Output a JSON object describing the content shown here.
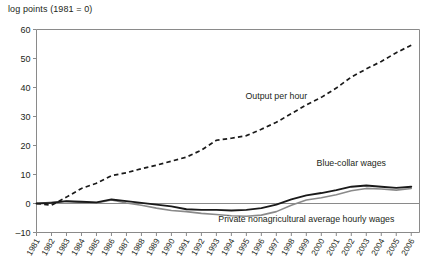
{
  "chart_data": {
    "type": "line",
    "title": "",
    "ylabel": "log points (1981 = 0)",
    "xlabel": "",
    "ylim": [
      -10,
      60
    ],
    "yticks": [
      -10,
      0,
      10,
      20,
      30,
      40,
      50,
      60
    ],
    "ytick_labels": [
      "–10",
      "0",
      "10",
      "20",
      "30",
      "40",
      "50",
      "60"
    ],
    "xlim": [
      1981,
      2006
    ],
    "grid": false,
    "legend_position": "inline-annotations",
    "categories": [
      1981,
      1982,
      1983,
      1984,
      1985,
      1986,
      1987,
      1988,
      1989,
      1990,
      1991,
      1992,
      1993,
      1994,
      1995,
      1996,
      1997,
      1998,
      1999,
      2000,
      2001,
      2002,
      2003,
      2004,
      2005,
      2006
    ],
    "xtick_labels": [
      "1981",
      "1982",
      "1983",
      "1984",
      "1985",
      "1986",
      "1987",
      "1988",
      "1989",
      "1990",
      "1991",
      "1992",
      "1993",
      "1994",
      "1995",
      "1996",
      "1997",
      "1998",
      "1999",
      "2000",
      "2001",
      "2002",
      "2003",
      "2004",
      "2005",
      "2006"
    ],
    "series": [
      {
        "name": "Output per hour",
        "style": "dashed",
        "color": "#1a1a1a",
        "label_x": 1997,
        "label_y": 36,
        "values": [
          0,
          -0.6,
          2.2,
          5.2,
          7.0,
          9.6,
          10.6,
          12.0,
          13.2,
          14.6,
          16.0,
          18.4,
          21.8,
          22.5,
          23.4,
          25.6,
          28.0,
          31.0,
          34.0,
          36.6,
          39.8,
          43.6,
          46.4,
          49.0,
          52.0,
          54.6
        ]
      },
      {
        "name": "Blue-collar wages",
        "style": "solid",
        "color": "#1a1a1a",
        "label_x": 2002,
        "label_y": 13,
        "values": [
          0,
          0.2,
          0.8,
          0.6,
          0.4,
          1.4,
          0.8,
          0.2,
          -0.4,
          -1.0,
          -2.0,
          -2.2,
          -2.2,
          -2.4,
          -2.2,
          -1.6,
          -0.4,
          1.4,
          2.8,
          3.6,
          4.6,
          5.8,
          6.2,
          5.8,
          5.4,
          5.8
        ]
      },
      {
        "name": "Private nonagricultural average hourly wages",
        "style": "solid",
        "color": "#8a8a8a",
        "label_x": 1999,
        "label_y": -6.5,
        "values": [
          0,
          0.4,
          0.8,
          0.4,
          0.2,
          1.2,
          0.2,
          -0.6,
          -1.6,
          -2.4,
          -2.8,
          -3.4,
          -3.8,
          -4.2,
          -4.4,
          -4.0,
          -2.8,
          -0.6,
          1.2,
          2.0,
          3.0,
          4.4,
          5.2,
          5.0,
          4.6,
          5.2
        ]
      }
    ]
  },
  "bottom_cut_text": ""
}
